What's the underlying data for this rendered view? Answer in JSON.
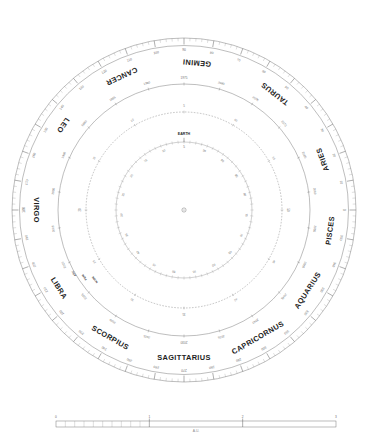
{
  "chart_data": {
    "type": "scatter",
    "title": "",
    "subtitle": "",
    "xlabel": "",
    "ylabel": "",
    "grid": false,
    "legend_position": "none",
    "center_marker": "sun-dot",
    "angular_axis": {
      "label": "Ecliptic longitude (degrees)",
      "range": [
        0,
        360
      ],
      "tick_step_minor": 2,
      "tick_step_major": 10,
      "label_step": 10,
      "zero_direction": "right",
      "direction": "counterclockwise",
      "tick_labels": [
        "0",
        "10",
        "20",
        "30",
        "40",
        "50",
        "60",
        "70",
        "80",
        "90",
        "100",
        "110",
        "120",
        "130",
        "140",
        "150",
        "160",
        "170",
        "180",
        "190",
        "200",
        "210",
        "220",
        "230",
        "240",
        "250",
        "260",
        "270",
        "280",
        "290",
        "300",
        "310",
        "320",
        "330",
        "340",
        "350"
      ]
    },
    "zodiac_ring": {
      "name": "constellation-band",
      "signs": [
        {
          "name": "ARIES",
          "center_deg": 20
        },
        {
          "name": "TAURUS",
          "center_deg": 52
        },
        {
          "name": "GEMINI",
          "center_deg": 85
        },
        {
          "name": "CANCER",
          "center_deg": 115
        },
        {
          "name": "LEO",
          "center_deg": 145
        },
        {
          "name": "VIRGO",
          "center_deg": 180
        },
        {
          "name": "LIBRA",
          "center_deg": 212
        },
        {
          "name": "SCORPIUS",
          "center_deg": 240
        },
        {
          "name": "SAGITTARIUS",
          "center_deg": 270
        },
        {
          "name": "CAPRICORNUS",
          "center_deg": 300
        },
        {
          "name": "AQUARIUS",
          "center_deg": 327
        },
        {
          "name": "PISCES",
          "center_deg": 352
        }
      ]
    },
    "rings": [
      {
        "id": "ring-outer-degrees",
        "role": "ecliptic-longitude-scale",
        "radius_px": 172,
        "style": "solid-with-ticks"
      },
      {
        "id": "ring-orbit-outer",
        "role": "outer-planet-orbit",
        "radius_px": 126,
        "style": "solid",
        "marker_labels": [
          "1975",
          "1980",
          "1985",
          "1990",
          "1995",
          "2000",
          "2005",
          "2010",
          "2015",
          "2020",
          "2025",
          "2030",
          "2035",
          "2040",
          "2045",
          "2050",
          "2055",
          "2060",
          "2065",
          "2070",
          "2075",
          "2080"
        ]
      },
      {
        "id": "ring-orbit-dotted",
        "role": "inner-planet-orbit",
        "radius_px": 98,
        "style": "dotted",
        "marker_labels": [
          "5",
          "10",
          "15",
          "20",
          "25",
          "30",
          "35",
          "40",
          "45",
          "50",
          "55",
          "60"
        ]
      },
      {
        "id": "ring-earth",
        "role": "earth-orbit",
        "radius_px": 68,
        "style": "solid",
        "title": "EARTH",
        "marker_labels": [
          "5",
          "10",
          "15",
          "20",
          "25",
          "30",
          "35",
          "40",
          "45",
          "50",
          "55",
          "60",
          "65",
          "70",
          "75",
          "80",
          "85",
          "90",
          "95"
        ],
        "node_labels": [
          "JAN",
          "FEB",
          "MAR",
          "APR",
          "MAY",
          "JUN",
          "JUL",
          "AUG",
          "SEP",
          "OCT",
          "NOV",
          "DEC"
        ]
      }
    ],
    "annotations": [
      {
        "text": "PERI",
        "angle_deg": 214,
        "radius_px": 120
      },
      {
        "text": "NODE",
        "angle_deg": 218,
        "radius_px": 113
      },
      {
        "text": "ASC",
        "angle_deg": 210,
        "radius_px": 127
      }
    ],
    "scale_bar": {
      "unit_label": "A.U.",
      "start_label": "0",
      "tick_labels": [
        "0",
        "1",
        "2",
        "3"
      ],
      "segments": 3,
      "subdivided_segment": 1,
      "subdivisions": 10
    }
  },
  "figure": {
    "caption": "",
    "background": "#ffffff",
    "line_color": "#6e6e6e",
    "text_color": "#3a3a3a",
    "accent_color": "#1d1d1d"
  }
}
